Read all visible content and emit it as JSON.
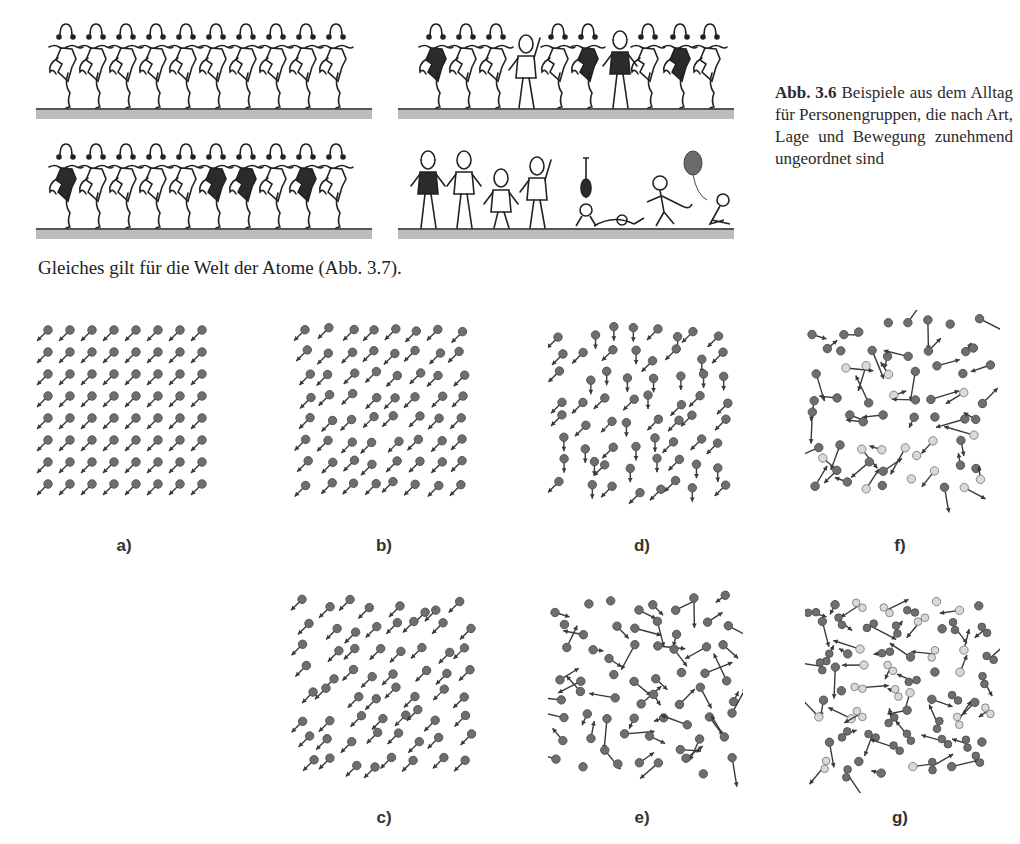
{
  "figure_3_6": {
    "caption_number": "Abb. 3.6",
    "caption_text": "Beispiele aus dem Alltag für Personengruppen, die nach Art, Lage und Bewegung zunehmend ungeordnet sind",
    "panels": [
      {
        "id": "top-left",
        "description": "10 identical cancan dancers in a row, all light dresses",
        "dancers": 10,
        "dark_dresses": []
      },
      {
        "id": "top-right",
        "description": "row of dancers with two different persons inserted, some dark dresses",
        "dancers": 10,
        "dark_dresses": [
          0,
          5,
          8
        ]
      },
      {
        "id": "bottom-left",
        "description": "10 cancan dancers in a row, some with dark dresses",
        "dancers": 10,
        "dark_dresses": [
          0,
          5,
          6,
          8
        ]
      },
      {
        "id": "bottom-right",
        "description": "disordered group of people: dancing women, walking kids, handstand, lying person, runner, sitting child with balloon"
      }
    ]
  },
  "body_text": "Gleiches gilt für die Welt der Atome (Abb. 3.7).",
  "figure_3_7": {
    "panels": [
      {
        "label": "a)",
        "description": "perfect 8x8 lattice, identical atoms, all arrows down-left"
      },
      {
        "label": "b)",
        "description": "slightly displaced lattice, all arrows down-left"
      },
      {
        "label": "c)",
        "description": "strongly displaced positions, all arrows down-left"
      },
      {
        "label": "d)",
        "description": "displaced positions, arrows down-left or down"
      },
      {
        "label": "e)",
        "description": "random positions and random motion directions"
      },
      {
        "label": "f)",
        "description": "random positions, random motion, two atom types (dark and light)"
      },
      {
        "label": "g)",
        "description": "random positions, random motion, two atom types and molecules"
      }
    ],
    "colors": {
      "atom_dark": "#6e6e6e",
      "atom_light": "#d9d9d9",
      "arrow": "#3a3a3a"
    }
  }
}
